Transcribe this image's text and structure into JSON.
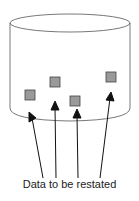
{
  "diagram": {
    "caption": "Data to be restated",
    "container": {
      "shape": "cylinder",
      "label": ""
    },
    "data_items": [
      {
        "x": 25,
        "y": 90
      },
      {
        "x": 50,
        "y": 77
      },
      {
        "x": 70,
        "y": 96
      },
      {
        "x": 106,
        "y": 72
      }
    ],
    "colors": {
      "stroke": "#333333",
      "item_fill": "#9a9a9a",
      "item_stroke": "#444444"
    }
  }
}
